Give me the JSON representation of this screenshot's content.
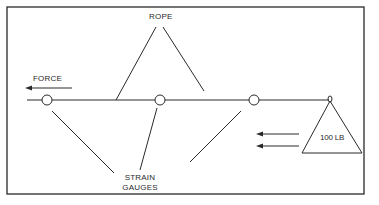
{
  "diagram": {
    "labels": {
      "rope": "ROPE",
      "force": "FORCE",
      "strain_gauges_line1": "STRAIN",
      "strain_gauges_line2": "GAUGES",
      "weight": "100 LB"
    },
    "components": [
      {
        "id": "rope",
        "type": "horizontal line"
      },
      {
        "id": "strain-gauge-1",
        "type": "circle on rope"
      },
      {
        "id": "strain-gauge-2",
        "type": "circle on rope"
      },
      {
        "id": "strain-gauge-3",
        "type": "circle on rope"
      },
      {
        "id": "weight",
        "type": "triangle",
        "label": "100 LB"
      },
      {
        "id": "force-arrow",
        "type": "arrow pointing left"
      },
      {
        "id": "weight-force-arrows",
        "type": "two arrows pointing left",
        "count": 2
      }
    ],
    "colors": {
      "stroke": "#2a2a2a",
      "background": "#ffffff"
    }
  }
}
